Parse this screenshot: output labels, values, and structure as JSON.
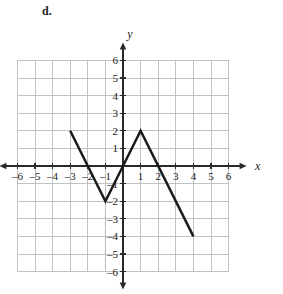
{
  "problem": {
    "label": "d."
  },
  "chart_data": {
    "type": "line",
    "title": "",
    "xlabel": "x",
    "ylabel": "y",
    "xlim": [
      -6.5,
      6.5
    ],
    "ylim": [
      -6.5,
      6.5
    ],
    "grid": true,
    "grid_step": 1,
    "legend": "none",
    "x_tick_labels": [
      "–6",
      "–5",
      "–4",
      "–3",
      "–2",
      "–1",
      "1",
      "2",
      "3",
      "4",
      "5",
      "6"
    ],
    "x_tick_values": [
      -6,
      -5,
      -4,
      -3,
      -2,
      -1,
      1,
      2,
      3,
      4,
      5,
      6
    ],
    "y_tick_labels": [
      "6",
      "5",
      "4",
      "3",
      "2",
      "1",
      "–1",
      "–2",
      "–3",
      "–4",
      "–5",
      "–6"
    ],
    "y_tick_values": [
      6,
      5,
      4,
      3,
      2,
      1,
      -1,
      -2,
      -3,
      -4,
      -5,
      -6
    ],
    "series": [
      {
        "name": "piecewise-graph",
        "kind": "polyline",
        "points": [
          [
            -3,
            2
          ],
          [
            -1,
            -2
          ],
          [
            1,
            2
          ],
          [
            4,
            -4
          ]
        ]
      }
    ],
    "annotations": [
      {
        "kind": "dashed-vertical-segment",
        "x": -1,
        "y_from": -2,
        "y_to": -6
      }
    ],
    "grid_extent": {
      "x_min": -6,
      "x_max": 6,
      "y_min": -6,
      "y_max": 6
    }
  },
  "colors": {
    "grid": "#b9bcbe",
    "axis": "#2a2a2a",
    "curve": "#1a1a1a",
    "text": "#1a1a1a",
    "background": "#ffffff"
  }
}
